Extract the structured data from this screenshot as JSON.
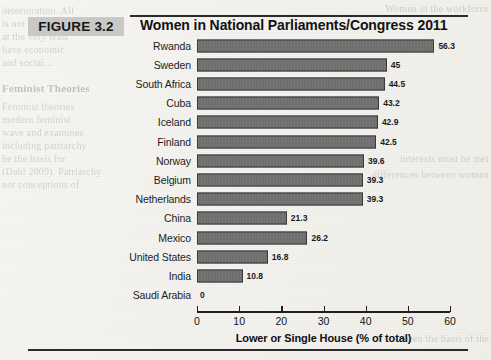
{
  "figure": {
    "label": "FIGURE 3.2",
    "title": "Women in National Parliaments/Congress 2011"
  },
  "background_text": {
    "left": [
      "deterioration. All",
      "is not available",
      "at the very least",
      "have economic",
      "and social...",
      "",
      "Feminist Theories",
      "",
      "Feminist theories",
      "modern feminist",
      "wave and examines",
      "including patriarchy",
      "be the basis for",
      "(Dahl 2009). Patriarchy",
      "not conceptions of"
    ],
    "right": [
      "Women in the workforce",
      "interests must be met",
      "differences between women",
      "been the basis of the"
    ]
  },
  "chart_data": {
    "type": "bar",
    "orientation": "horizontal",
    "title": "Women in National Parliaments/Congress 2011",
    "xlabel": "Lower or Single House (% of total)",
    "ylabel": "",
    "xlim": [
      0,
      60
    ],
    "xticks": [
      0,
      10,
      20,
      30,
      40,
      50,
      60
    ],
    "grid": false,
    "legend": false,
    "categories": [
      "Rwanda",
      "Sweden",
      "South Africa",
      "Cuba",
      "Iceland",
      "Finland",
      "Norway",
      "Belgium",
      "Netherlands",
      "China",
      "Mexico",
      "United States",
      "India",
      "Saudi Arabia"
    ],
    "values": [
      56.3,
      45,
      44.5,
      43.2,
      42.9,
      42.5,
      39.6,
      39.3,
      39.3,
      21.3,
      26.2,
      16.8,
      10.8,
      0
    ],
    "value_labels": [
      "56.3",
      "45",
      "44.5",
      "43.2",
      "42.9",
      "42.5",
      "39.6",
      "39.3",
      "39.3",
      "21.3",
      "26.2",
      "16.8",
      "10.8",
      "0"
    ],
    "colors": {
      "bar_fill": "#6f6f6f",
      "bar_border": "#3a3a3a",
      "axis": "#1f1f1f",
      "label_box": "#c9c8c6",
      "page": "#f4f3f0"
    }
  }
}
